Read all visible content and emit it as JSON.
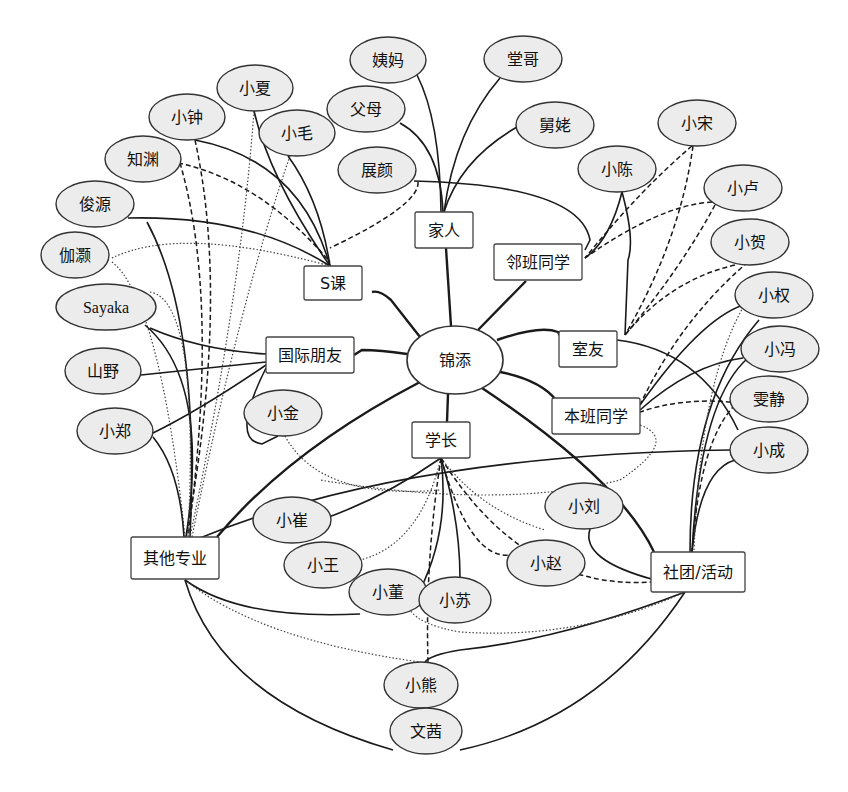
{
  "diagram": {
    "title": "",
    "center": {
      "id": "jintian",
      "label": "锦添",
      "x": 455,
      "y": 360,
      "rx": 48,
      "ry": 34
    },
    "groups": [
      {
        "id": "s_course",
        "label": "S课",
        "x": 333,
        "y": 283,
        "w": 58,
        "h": 34
      },
      {
        "id": "family",
        "label": "家人",
        "x": 444,
        "y": 230,
        "w": 58,
        "h": 36
      },
      {
        "id": "neighbor_class",
        "label": "邻班同学",
        "x": 538,
        "y": 262,
        "w": 88,
        "h": 36
      },
      {
        "id": "intl_friends",
        "label": "国际朋友",
        "x": 310,
        "y": 355,
        "w": 88,
        "h": 36
      },
      {
        "id": "roommates",
        "label": "室友",
        "x": 588,
        "y": 349,
        "w": 58,
        "h": 36
      },
      {
        "id": "own_class",
        "label": "本班同学",
        "x": 596,
        "y": 416,
        "w": 88,
        "h": 36
      },
      {
        "id": "seniors",
        "label": "学长",
        "x": 441,
        "y": 440,
        "w": 58,
        "h": 36
      },
      {
        "id": "other_majors",
        "label": "其他专业",
        "x": 175,
        "y": 558,
        "w": 88,
        "h": 42
      },
      {
        "id": "clubs",
        "label": "社团/活动",
        "x": 698,
        "y": 572,
        "w": 94,
        "h": 40
      }
    ],
    "people": [
      {
        "id": "yima",
        "label": "姨妈",
        "x": 388,
        "y": 60,
        "rx": 38,
        "ry": 23
      },
      {
        "id": "tangge",
        "label": "堂哥",
        "x": 523,
        "y": 59,
        "rx": 39,
        "ry": 23
      },
      {
        "id": "xiaxia",
        "label": "小夏",
        "x": 255,
        "y": 88,
        "rx": 38,
        "ry": 23
      },
      {
        "id": "fumu",
        "label": "父母",
        "x": 366,
        "y": 109,
        "rx": 39,
        "ry": 23
      },
      {
        "id": "jiujiu",
        "label": "舅姥",
        "x": 555,
        "y": 125,
        "rx": 39,
        "ry": 23
      },
      {
        "id": "xiaosong",
        "label": "小宋",
        "x": 697,
        "y": 123,
        "rx": 39,
        "ry": 23
      },
      {
        "id": "xiaozhong",
        "label": "小钟",
        "x": 187,
        "y": 117,
        "rx": 38,
        "ry": 23
      },
      {
        "id": "xiaomao",
        "label": "小毛",
        "x": 297,
        "y": 133,
        "rx": 38,
        "ry": 23
      },
      {
        "id": "zhiyuan",
        "label": "知渊",
        "x": 143,
        "y": 159,
        "rx": 38,
        "ry": 23
      },
      {
        "id": "zhanyan",
        "label": "展颜",
        "x": 377,
        "y": 170,
        "rx": 39,
        "ry": 23
      },
      {
        "id": "xiaochen",
        "label": "小陈",
        "x": 617,
        "y": 169,
        "rx": 39,
        "ry": 23
      },
      {
        "id": "xiaolu",
        "label": "小卢",
        "x": 743,
        "y": 188,
        "rx": 39,
        "ry": 23
      },
      {
        "id": "junyuan",
        "label": "俊源",
        "x": 95,
        "y": 204,
        "rx": 39,
        "ry": 23
      },
      {
        "id": "jiahao",
        "label": "伽灏",
        "x": 75,
        "y": 255,
        "rx": 34,
        "ry": 23
      },
      {
        "id": "xiaohe",
        "label": "小贺",
        "x": 750,
        "y": 242,
        "rx": 39,
        "ry": 23
      },
      {
        "id": "sayaka",
        "label": "Sayaka",
        "x": 106,
        "y": 307,
        "rx": 50,
        "ry": 23,
        "latin": true
      },
      {
        "id": "xiaoquan",
        "label": "小权",
        "x": 774,
        "y": 295,
        "rx": 39,
        "ry": 23
      },
      {
        "id": "shanye",
        "label": "山野",
        "x": 103,
        "y": 371,
        "rx": 38,
        "ry": 23
      },
      {
        "id": "xiaofeng",
        "label": "小冯",
        "x": 780,
        "y": 349,
        "rx": 39,
        "ry": 23
      },
      {
        "id": "xiaojin",
        "label": "小金",
        "x": 283,
        "y": 413,
        "rx": 39,
        "ry": 23
      },
      {
        "id": "wenjing",
        "label": "雯静",
        "x": 769,
        "y": 399,
        "rx": 39,
        "ry": 23
      },
      {
        "id": "xiaozheng",
        "label": "小郑",
        "x": 115,
        "y": 431,
        "rx": 38,
        "ry": 23
      },
      {
        "id": "xiaocheng",
        "label": "小成",
        "x": 769,
        "y": 450,
        "rx": 39,
        "ry": 23
      },
      {
        "id": "xiaoliu",
        "label": "小刘",
        "x": 584,
        "y": 506,
        "rx": 39,
        "ry": 23
      },
      {
        "id": "xiaocui",
        "label": "小崔",
        "x": 292,
        "y": 520,
        "rx": 39,
        "ry": 23
      },
      {
        "id": "xiaowang",
        "label": "小王",
        "x": 323,
        "y": 565,
        "rx": 39,
        "ry": 23
      },
      {
        "id": "xiaozhao",
        "label": "小赵",
        "x": 546,
        "y": 563,
        "rx": 39,
        "ry": 23
      },
      {
        "id": "xiaodong",
        "label": "小董",
        "x": 388,
        "y": 592,
        "rx": 39,
        "ry": 23
      },
      {
        "id": "xiaosu",
        "label": "小苏",
        "x": 455,
        "y": 600,
        "rx": 36,
        "ry": 23
      },
      {
        "id": "xiaoxiong",
        "label": "小熊",
        "x": 421,
        "y": 685,
        "rx": 37,
        "ry": 23
      },
      {
        "id": "wenxi",
        "label": "文茜",
        "x": 426,
        "y": 731,
        "rx": 36,
        "ry": 23
      }
    ],
    "edges": [
      {
        "style": "thick",
        "d": "M 420 337 L 391 300 Q 380 290 372 292"
      },
      {
        "style": "thick",
        "d": "M 451 326 L 446 248"
      },
      {
        "style": "thick",
        "d": "M 478 330 L 526 281"
      },
      {
        "style": "thick",
        "d": "M 407 354 Q 380 350 362 350 L 354 355"
      },
      {
        "style": "thick",
        "d": "M 497 340 Q 540 325 558 332 L 562 340"
      },
      {
        "style": "thick",
        "d": "M 500 372 Q 540 380 556 400"
      },
      {
        "style": "thick",
        "d": "M 448 394 L 447 422"
      },
      {
        "style": "thick",
        "d": "M 420 382 Q 290 450 217 537"
      },
      {
        "style": "thick",
        "d": "M 482 388 Q 620 480 654 552"
      },
      {
        "style": "solid",
        "d": "M 417 75 Q 440 120 441 212"
      },
      {
        "style": "solid",
        "d": "M 500 78 Q 455 130 444 212"
      },
      {
        "style": "solid",
        "d": "M 400 123 Q 440 145 443 212"
      },
      {
        "style": "solid",
        "d": "M 517 127 Q 460 160 444 212"
      },
      {
        "style": "solid",
        "d": "M 414 181 Q 580 185 590 240 L 585 250"
      },
      {
        "style": "solid",
        "d": "M 254 111 Q 270 180 330 266"
      },
      {
        "style": "solid",
        "d": "M 195 140 Q 300 160 330 266"
      },
      {
        "style": "solid",
        "d": "M 288 156 Q 320 200 330 266"
      },
      {
        "style": "dashed",
        "d": "M 178 163 Q 260 180 330 262"
      },
      {
        "style": "solid",
        "d": "M 128 218 Q 250 215 330 266"
      },
      {
        "style": "dotted",
        "d": "M 112 258 Q 180 225 330 266"
      },
      {
        "style": "dashed",
        "d": "M 418 182 Q 420 205 330 248"
      },
      {
        "style": "solid",
        "d": "M 622 192 Q 610 240 585 258"
      },
      {
        "style": "dashed",
        "d": "M 692 146 Q 640 190 585 258"
      },
      {
        "style": "dashed",
        "d": "M 712 202 Q 660 205 585 258"
      },
      {
        "style": "dashed",
        "d": "M 693 146 Q 680 240 625 335"
      },
      {
        "style": "dashed",
        "d": "M 715 205 Q 680 270 625 335"
      },
      {
        "style": "dashed",
        "d": "M 735 265 Q 670 280 625 335"
      },
      {
        "style": "solid",
        "d": "M 622 192 Q 635 240 628 260 L 625 335"
      },
      {
        "style": "solid",
        "d": "M 617 340 Q 700 350 738 430"
      },
      {
        "style": "solid",
        "d": "M 743 305 Q 700 320 640 405"
      },
      {
        "style": "solid",
        "d": "M 743 358 Q 690 365 640 410"
      },
      {
        "style": "dashed",
        "d": "M 731 402 Q 680 398 640 412"
      },
      {
        "style": "dashed",
        "d": "M 748 262 Q 680 320 640 405"
      },
      {
        "style": "dotted",
        "d": "M 640 425 Q 680 440 620 480 Q 500 510 320 480"
      },
      {
        "style": "solid",
        "d": "M 730 450 Q 400 455 200 538"
      },
      {
        "style": "dotted",
        "d": "M 285 436 Q 320 500 440 490"
      },
      {
        "style": "solid",
        "d": "M 759 320 Q 690 400 690 552"
      },
      {
        "style": "solid",
        "d": "M 748 358 Q 700 400 692 552"
      },
      {
        "style": "solid",
        "d": "M 735 460 Q 700 470 692 552"
      },
      {
        "style": "dotted",
        "d": "M 745 304 Q 700 380 694 552"
      },
      {
        "style": "dashed",
        "d": "M 735 405 Q 700 440 692 552"
      },
      {
        "style": "solid",
        "d": "M 590 529 Q 580 560 655 580"
      },
      {
        "style": "solid",
        "d": "M 441 458 Q 380 500 320 520"
      },
      {
        "style": "dotted",
        "d": "M 441 458 Q 420 545 360 560"
      },
      {
        "style": "solid",
        "d": "M 441 458 Q 450 530 420 590"
      },
      {
        "style": "dashed",
        "d": "M 441 458 Q 425 560 428 662"
      },
      {
        "style": "solid",
        "d": "M 441 458 Q 460 520 460 578"
      },
      {
        "style": "dashed",
        "d": "M 441 458 Q 470 560 510 555"
      },
      {
        "style": "dotted",
        "d": "M 441 458 Q 480 510 545 530"
      },
      {
        "style": "dashed",
        "d": "M 441 458 Q 530 600 670 580"
      },
      {
        "style": "solid",
        "d": "M 185 580 Q 240 620 360 614"
      },
      {
        "style": "dotted",
        "d": "M 185 580 Q 260 640 420 662"
      },
      {
        "style": "solid",
        "d": "M 185 580 Q 220 700 393 750"
      },
      {
        "style": "solid",
        "d": "M 685 592 Q 560 640 460 650 Q 430 655 425 662"
      },
      {
        "style": "dotted",
        "d": "M 685 592 Q 580 640 460 632 Q 420 625 410 610"
      },
      {
        "style": "solid",
        "d": "M 685 592 Q 600 720 460 750"
      },
      {
        "style": "solid",
        "d": "M 147 222 Q 200 320 190 537"
      },
      {
        "style": "dotted",
        "d": "M 112 262 Q 160 300 185 537"
      },
      {
        "style": "dashed",
        "d": "M 195 140 Q 230 300 186 537"
      },
      {
        "style": "dashed",
        "d": "M 180 163 Q 220 300 188 537"
      },
      {
        "style": "dotted",
        "d": "M 254 111 Q 240 300 190 537"
      },
      {
        "style": "dotted",
        "d": "M 290 156 Q 240 300 192 537"
      },
      {
        "style": "solid",
        "d": "M 145 325 Q 210 380 186 537"
      },
      {
        "style": "solid",
        "d": "M 150 328 Q 200 350 266 354"
      },
      {
        "style": "solid",
        "d": "M 141 375 L 266 362"
      },
      {
        "style": "solid",
        "d": "M 153 433 Q 200 410 266 365"
      },
      {
        "style": "solid",
        "d": "M 153 437 Q 180 470 184 537"
      },
      {
        "style": "dotted",
        "d": "M 150 292 Q 200 300 188 537"
      },
      {
        "style": "solid",
        "d": "M 266 368 Q 230 440 262 444 L 278 436"
      }
    ]
  }
}
